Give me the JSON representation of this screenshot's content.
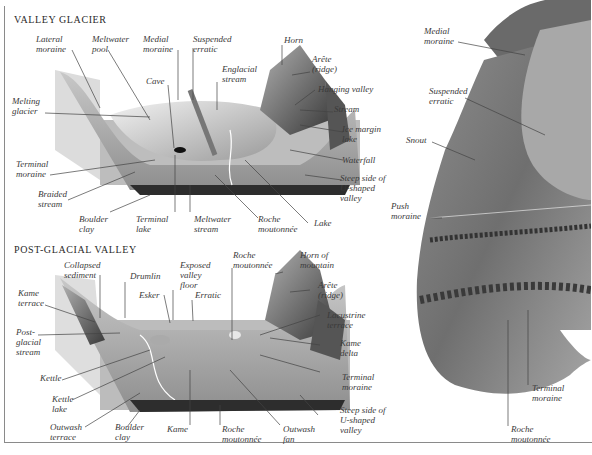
{
  "panels": {
    "valley_glacier": {
      "title": "VALLEY GLACIER",
      "labels": {
        "lateral_moraine": "Lateral\nmoraine",
        "meltwater_pool": "Meltwater\npool",
        "medial_moraine": "Medial\nmoraine",
        "suspended_erratic": "Suspended\nerratic",
        "horn": "Horn",
        "arete": "Arête\n(ridge)",
        "englacial_stream": "Englacial\nstream",
        "cave": "Cave",
        "hanging_valley": "Hanging valley",
        "stream": "Stream",
        "melting_glacier": "Melting\nglacier",
        "ice_margin_lake": "Ice margin\nlake",
        "waterfall": "Waterfall",
        "terminal_moraine": "Terminal\nmoraine",
        "steep_side": "Steep side of\nU-shaped\nvalley",
        "braided_stream": "Braided\nstream",
        "boulder_clay": "Boulder\nclay",
        "terminal_lake": "Terminal\nlake",
        "meltwater_stream": "Meltwater\nstream",
        "roche_moutonnee": "Roche\nmoutonnée",
        "lake": "Lake"
      }
    },
    "post_glacial_valley": {
      "title": "POST-GLACIAL VALLEY",
      "labels": {
        "collapsed_sediment": "Collapsed\nsediment",
        "drumlin": "Drumlin",
        "exposed_valley_floor": "Exposed\nvalley\nfloor",
        "roche_moutonnee_top": "Roche\nmoutonnée",
        "horn_of_mountain": "Horn of\nmountain",
        "kame_terrace": "Kame\nterrace",
        "esker": "Esker",
        "erratic": "Erratic",
        "arete": "Arête\n(ridge)",
        "post_glacial_stream": "Post-\nglacial\nstream",
        "lacustrine_terrace": "Lacustrine\nterrace",
        "kame_delta": "Kame\ndelta",
        "kettle": "Kettle",
        "terminal_moraine": "Terminal\nmoraine",
        "kettle_lake": "Kettle\nlake",
        "steep_side": "Steep side of\nU-shaped\nvalley",
        "outwash_terrace": "Outwash\nterrace",
        "boulder_clay": "Boulder\nclay",
        "kame": "Kame",
        "roche_moutonnee_bottom": "Roche\nmoutonnée",
        "outwash_fan": "Outwash\nfan"
      }
    },
    "glacier_photo": {
      "labels": {
        "medial_moraine": "Medial\nmoraine",
        "suspended_erratic": "Suspended\nerratic",
        "snout": "Snout",
        "push_moraine": "Push\nmoraine",
        "terminal_moraine": "Terminal\nmoraine",
        "roche_moutonnee": "Roche\nmoutonnée"
      }
    }
  }
}
